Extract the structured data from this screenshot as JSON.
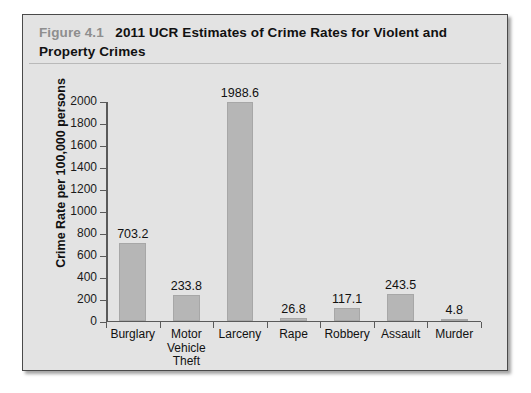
{
  "figure": {
    "label": "Figure 4.1",
    "title": "2011 UCR Estimates of Crime Rates for Violent and Property Crimes"
  },
  "colors": {
    "card_background": "#e3e3e3",
    "card_border": "#4a4a4a",
    "bar_fill": "#b6b6b6",
    "axis_line": "#5a5a5a",
    "label_gray": "#8e8e8e",
    "text_black": "#111111"
  },
  "chart_data": {
    "type": "bar",
    "title": "2011 UCR Estimates of Crime Rates for Violent and Property Crimes",
    "xlabel": "",
    "ylabel": "Crime Rate per 100,000 persons",
    "ylim": [
      0,
      2000
    ],
    "ytick_step": 200,
    "yticks": [
      0,
      200,
      400,
      600,
      800,
      1000,
      1200,
      1400,
      1600,
      1800,
      2000
    ],
    "ytick_labels": [
      "0",
      "200",
      "400",
      "600",
      "800",
      "1000",
      "1200",
      "1400",
      "1600",
      "1800",
      "2000"
    ],
    "grid": false,
    "legend": false,
    "data_labels": true,
    "categories": [
      "Burglary",
      "Motor Vehicle Theft",
      "Larceny",
      "Rape",
      "Robbery",
      "Assault",
      "Murder"
    ],
    "category_display": [
      [
        "Burglary"
      ],
      [
        "Motor",
        "Vehicle",
        "Theft"
      ],
      [
        "Larceny"
      ],
      [
        "Rape"
      ],
      [
        "Robbery"
      ],
      [
        "Assault"
      ],
      [
        "Murder"
      ]
    ],
    "values": [
      703.2,
      233.8,
      1988.6,
      26.8,
      117.1,
      243.5,
      4.8
    ],
    "value_labels": [
      "703.2",
      "233.8",
      "1988.6",
      "26.8",
      "117.1",
      "243.5",
      "4.8"
    ]
  }
}
